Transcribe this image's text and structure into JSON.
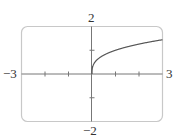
{
  "chart_data": {
    "type": "line",
    "title": "",
    "function": "y = x^(1/3), x >= 0",
    "xlabel": "",
    "ylabel": "",
    "xlim": [
      -3,
      3
    ],
    "ylim": [
      -2,
      2
    ],
    "x_ticks": [
      -2,
      -1,
      1,
      2
    ],
    "y_ticks": [
      -1,
      1
    ],
    "grid": false,
    "axis_labels": {
      "xmin": "−3",
      "xmax": "3",
      "ymax": "2",
      "ymin": "−2"
    },
    "series": [
      {
        "name": "curve",
        "x": [
          0,
          0.01,
          0.05,
          0.1,
          0.25,
          0.5,
          1,
          1.5,
          2,
          2.5,
          3
        ],
        "y": [
          0,
          0.215,
          0.368,
          0.464,
          0.63,
          0.794,
          1.0,
          1.145,
          1.26,
          1.357,
          1.442
        ]
      }
    ],
    "colors": {
      "frame": "#c8c8c8",
      "axes": "#777777",
      "curve": "#555555"
    }
  }
}
